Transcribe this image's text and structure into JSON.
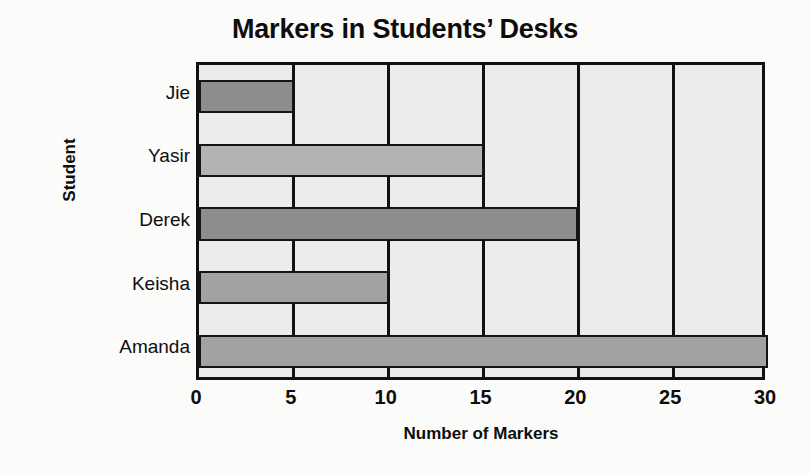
{
  "chart_data": {
    "type": "bar",
    "orientation": "horizontal",
    "title": "Markers in Students’ Desks",
    "xlabel": "Number of Markers",
    "ylabel": "Student",
    "categories": [
      "Jie",
      "Yasir",
      "Derek",
      "Keisha",
      "Amanda"
    ],
    "values": [
      5,
      15,
      20,
      10,
      30
    ],
    "xlim": [
      0,
      30
    ],
    "xticks": [
      0,
      5,
      10,
      15,
      20,
      25,
      30
    ],
    "xtick_labels": [
      "0",
      "5",
      "10",
      "15",
      "20",
      "25",
      "30"
    ],
    "grid": true,
    "grid_axis": "x",
    "legend": null,
    "bar_colors": [
      "#8d8d8d",
      "#b3b3b3",
      "#8d8d8d",
      "#a2a2a2",
      "#a2a2a2"
    ],
    "plot_background": "#ebedeb",
    "axis_color": "#121212",
    "bars": [
      {
        "category": "Jie",
        "value": 5,
        "color": "#8d8d8d"
      },
      {
        "category": "Yasir",
        "value": 15,
        "color": "#b3b3b3"
      },
      {
        "category": "Derek",
        "value": 20,
        "color": "#8d8d8d"
      },
      {
        "category": "Keisha",
        "value": 10,
        "color": "#a2a2a2"
      },
      {
        "category": "Amanda",
        "value": 30,
        "color": "#a2a2a2"
      }
    ]
  }
}
